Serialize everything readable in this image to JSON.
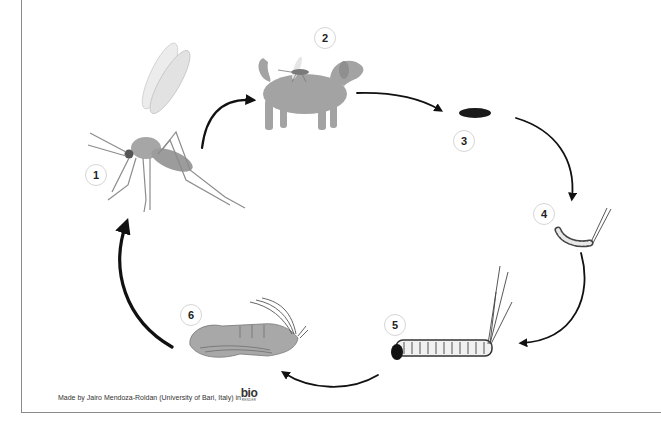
{
  "diagram": {
    "stages": [
      {
        "number": "1",
        "label": "Adult mosquito",
        "icon": "adult-mosquito"
      },
      {
        "number": "2",
        "label": "Mosquito feeding on dog host",
        "icon": "dog-with-mosquito"
      },
      {
        "number": "3",
        "label": "Egg",
        "icon": "egg"
      },
      {
        "number": "4",
        "label": "Early larva",
        "icon": "early-larva"
      },
      {
        "number": "5",
        "label": "Late larva",
        "icon": "late-larva"
      },
      {
        "number": "6",
        "label": "Pupa",
        "icon": "pupa"
      }
    ],
    "arrows": [
      {
        "from": "1",
        "to": "2"
      },
      {
        "from": "2",
        "to": "3"
      },
      {
        "from": "3",
        "to": "4"
      },
      {
        "from": "4",
        "to": "5"
      },
      {
        "from": "5",
        "to": "6"
      },
      {
        "from": "6",
        "to": "1"
      }
    ]
  },
  "footer": {
    "credit": "Made by Jairo Mendoza-Roldan (University of Bari, Italy) in",
    "logo_main": "bio",
    "logo_sub": "RENDER"
  },
  "colors": {
    "arrow": "#111111",
    "illustration": "#9a9a9a",
    "frame": "#8a8a8a",
    "badge_border": "#d6d6d6"
  }
}
